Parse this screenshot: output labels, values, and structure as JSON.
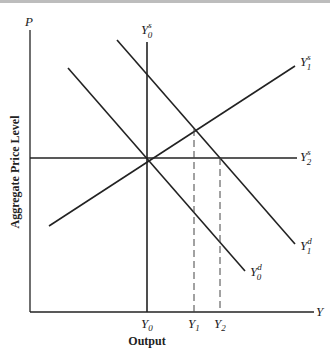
{
  "diagram": {
    "type": "aggregate supply / aggregate demand",
    "axes": {
      "y_axis_symbol": "P",
      "x_axis_symbol": "Y",
      "y_axis_title": "Aggregate Price Level",
      "x_axis_title": "Output"
    },
    "curves": [
      {
        "id": "Y0s",
        "base": "Y",
        "sub": "0",
        "sup": "s",
        "kind": "vertical supply"
      },
      {
        "id": "Y1s",
        "base": "Y",
        "sub": "1",
        "sup": "s",
        "kind": "upward sloping supply"
      },
      {
        "id": "Y2s",
        "base": "Y",
        "sub": "2",
        "sup": "s",
        "kind": "horizontal supply"
      },
      {
        "id": "Y0d",
        "base": "Y",
        "sub": "0",
        "sup": "d",
        "kind": "demand"
      },
      {
        "id": "Y1d",
        "base": "Y",
        "sub": "1",
        "sup": "d",
        "kind": "shifted demand"
      }
    ],
    "x_ticks": [
      {
        "base": "Y",
        "sub": "0"
      },
      {
        "base": "Y",
        "sub": "1"
      },
      {
        "base": "Y",
        "sub": "2"
      }
    ]
  }
}
